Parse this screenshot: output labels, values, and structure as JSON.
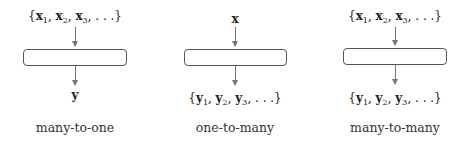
{
  "diagram": {
    "panels": [
      {
        "id": "many-to-one",
        "input": {
          "open": "{",
          "items": [
            {
              "var": "x",
              "sub": "1"
            },
            {
              "var": "x",
              "sub": "2"
            },
            {
              "var": "x",
              "sub": "3"
            }
          ],
          "ellipsis": ", . . .",
          "close": "}"
        },
        "output": {
          "single": "y"
        },
        "caption": "many-to-one"
      },
      {
        "id": "one-to-many",
        "input": {
          "single": "x"
        },
        "output": {
          "open": "{",
          "items": [
            {
              "var": "y",
              "sub": "1"
            },
            {
              "var": "y",
              "sub": "2"
            },
            {
              "var": "y",
              "sub": "3"
            }
          ],
          "ellipsis": ", . . .",
          "close": "}"
        },
        "caption": "one-to-many"
      },
      {
        "id": "many-to-many",
        "input": {
          "open": "{",
          "items": [
            {
              "var": "x",
              "sub": "1"
            },
            {
              "var": "x",
              "sub": "2"
            },
            {
              "var": "x",
              "sub": "3"
            }
          ],
          "ellipsis": ", . . .",
          "close": "}"
        },
        "output": {
          "open": "{",
          "items": [
            {
              "var": "y",
              "sub": "1"
            },
            {
              "var": "y",
              "sub": "2"
            },
            {
              "var": "y",
              "sub": "3"
            }
          ],
          "ellipsis": ", . . .",
          "close": "}"
        },
        "caption": "many-to-many"
      }
    ],
    "colors": {
      "box_border": "#555555",
      "arrow": "#777777",
      "text": "#222222"
    }
  }
}
